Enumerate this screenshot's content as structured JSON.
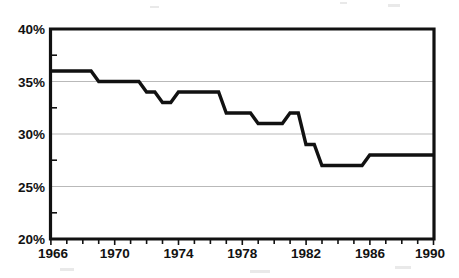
{
  "chart_data": {
    "type": "line",
    "title": "",
    "subtitle": "",
    "xlabel": "",
    "ylabel": "",
    "xlim": [
      1966,
      1990
    ],
    "ylim": [
      20,
      40
    ],
    "y_tick_labels": [
      "20%",
      "25%",
      "30%",
      "35%",
      "40%"
    ],
    "y_tick_values": [
      20,
      25,
      30,
      35,
      40
    ],
    "x_tick_labels": [
      "1966",
      "1970",
      "1974",
      "1978",
      "1982",
      "1986",
      "1990"
    ],
    "x_tick_values": [
      1966,
      1970,
      1974,
      1978,
      1982,
      1986,
      1990
    ],
    "x_minor_tick_values": [
      1966,
      1967,
      1968,
      1969,
      1970,
      1971,
      1972,
      1973,
      1974,
      1975,
      1976,
      1977,
      1978,
      1979,
      1980,
      1981,
      1982,
      1983,
      1984,
      1985,
      1986,
      1987,
      1988,
      1989,
      1990
    ],
    "y_minor_tick_values": [
      22.5,
      27.5,
      32.5,
      37.5
    ],
    "grid": "horizontal",
    "legend": "none",
    "units": "percent",
    "series": [
      {
        "name": "value",
        "color": "#111111",
        "x": [
          1966,
          1967,
          1968,
          1969,
          1970,
          1971,
          1972,
          1973,
          1974,
          1975,
          1976,
          1977,
          1978,
          1979,
          1980,
          1981,
          1982,
          1983,
          1984,
          1985,
          1986,
          1987,
          1988,
          1989,
          1990
        ],
        "values": [
          36,
          36,
          36,
          35,
          35,
          35,
          34,
          33,
          34,
          34,
          34,
          32,
          32,
          31,
          31,
          32,
          29,
          27,
          27,
          27,
          28,
          28,
          28,
          28,
          28
        ]
      }
    ]
  },
  "axis": {
    "y_labels": [
      "40%",
      "35%",
      "30%",
      "25%",
      "20%"
    ],
    "x_labels": [
      "1966",
      "1970",
      "1974",
      "1978",
      "1982",
      "1986",
      "1990"
    ]
  }
}
